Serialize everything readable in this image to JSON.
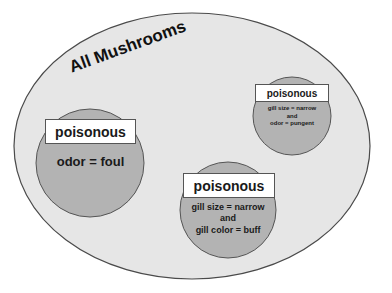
{
  "diagram": {
    "title": "All Mushrooms",
    "colors": {
      "outer_fill": "#e6e6e6",
      "outer_stroke": "#4a4a4a",
      "circle_fill": "#b3b3b3",
      "circle_stroke": "#555555",
      "label_fill": "#ffffff"
    },
    "groups": [
      {
        "id": "odor-foul",
        "label": "poisonous",
        "conditions": [
          "odor = foul"
        ]
      },
      {
        "id": "gill-size-color",
        "label": "poisonous",
        "conditions": [
          "gill size = narrow",
          "and",
          "gill color = buff"
        ]
      },
      {
        "id": "gill-size-odor",
        "label": "poisonous",
        "conditions": [
          "gill size = narrow",
          "and",
          "odor = pungent"
        ]
      }
    ]
  }
}
